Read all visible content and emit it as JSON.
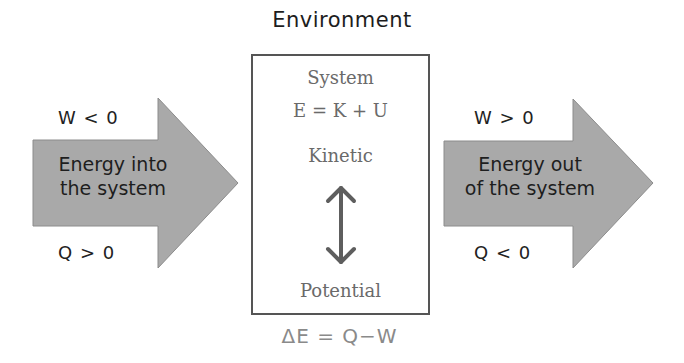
{
  "environment": {
    "title": "Environment"
  },
  "input_arrow": {
    "label_line1": "Energy into",
    "label_line2": "the system",
    "work_condition": "W < 0",
    "heat_condition": "Q > 0"
  },
  "output_arrow": {
    "label_line1": "Energy out",
    "label_line2": "of the system",
    "work_condition": "W > 0",
    "heat_condition": "Q < 0"
  },
  "system": {
    "title": "System",
    "energy_equation": "E = K + U",
    "kinetic_label": "Kinetic",
    "potential_label": "Potential",
    "exchange_icon": "double-headed-vertical-arrow"
  },
  "first_law": "ΔE = Q−W",
  "colors": {
    "arrow_fill": "#a9a9a9",
    "arrow_stroke": "#8c8c8c",
    "box_border": "#555555",
    "system_text": "#6a6a6a",
    "equation_text": "#8a8a8a"
  }
}
